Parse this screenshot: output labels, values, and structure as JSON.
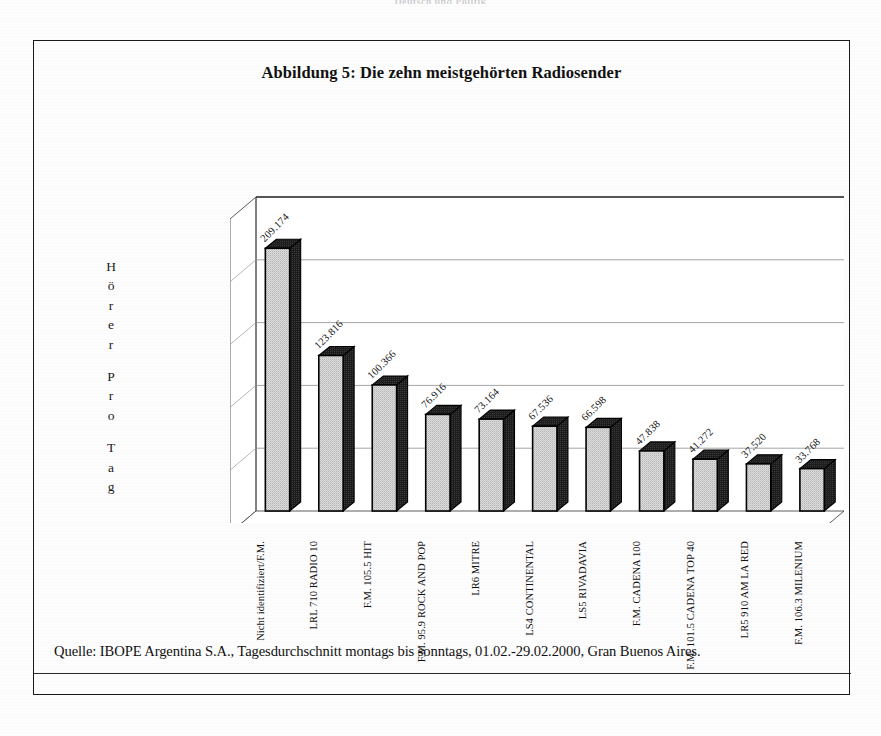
{
  "page": {
    "running_head": "Deutsch und Politik",
    "background": "#fdfdfd",
    "frame_color": "#1a1a1a"
  },
  "figure": {
    "title": "Abbildung 5: Die zehn meistgehörten Radiosender",
    "y_axis_title": "Hörer pro Tag",
    "y_axis_letters": [
      "H",
      "ö",
      "r",
      "e",
      "r",
      "",
      "P",
      "r",
      "o",
      "",
      "T",
      "a",
      "g"
    ],
    "caption": "Quelle: IBOPE Argentina S.A., Tagesdurchschnitt montags bis sonntags, 01.02.-29.02.2000, Gran Buenos Aires."
  },
  "chart_data": {
    "type": "bar",
    "title": "Abbildung 5: Die zehn meistgehörten Radiosender",
    "xlabel": "",
    "ylabel": "Hörer pro Tag",
    "ylim": [
      0,
      250000
    ],
    "grid": true,
    "gridlines": [
      50000,
      100000,
      150000,
      200000
    ],
    "legend": "none",
    "three_d": true,
    "bar_fill": "#d8d8d8",
    "bar_outline": "#000000",
    "bar_side": "#141414",
    "categories": [
      "Nicht identifiziert/F.M.",
      "LRL 710 RADIO 10",
      "F.M. 105.5 HIT",
      "F.M. 95.9 ROCK AND POP",
      "LR6 MITRE",
      "LS4 CONTINENTAL",
      "LS5 RIVADAVIA",
      "F.M. CADENA 100",
      "F.M. 101.5 CADENA TOP 40",
      "LR5 910 AM LA RED",
      "F.M. 106.3 MILENIUM"
    ],
    "values": [
      209174,
      123816,
      100366,
      76916,
      73164,
      67536,
      66598,
      47838,
      41272,
      37520,
      33768
    ],
    "value_labels": [
      "209.174",
      "123.816",
      "100.366",
      "76.916",
      "73.164",
      "67.536",
      "66.598",
      "47.838",
      "41.272",
      "37.520",
      "33.768"
    ]
  }
}
